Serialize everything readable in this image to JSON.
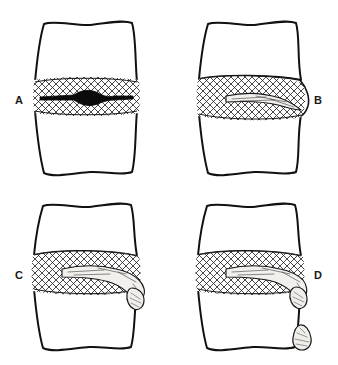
{
  "figure": {
    "background_color": "#ffffff",
    "ink_color": "#111111",
    "width": 338,
    "height": 365,
    "panel_count": 4
  },
  "panels": [
    {
      "id": "A",
      "label": "A",
      "label_position": "left",
      "label_x": 19,
      "label_y": 101,
      "stage_name": "disc degeneration",
      "description": "Intact vertebral bodies with hatched intervertebral disc and a dark spindle-shaped nucleus pulposus contained within the annulus.",
      "nucleus_style": "dark-solid",
      "has_extrusion": false,
      "has_free_fragment": false,
      "body_cx": 86,
      "body_top": 21,
      "body_bottom": 176,
      "disc_top": 80,
      "disc_bottom": 113
    },
    {
      "id": "B",
      "label": "B",
      "label_position": "right",
      "label_x": 318,
      "label_y": 101,
      "stage_name": "disc protrusion",
      "description": "Nucleus pulposus displaced posteriorly, bulging the annulus and contour of the disc margin to the right without rupture.",
      "nucleus_style": "light-outlined-tongue",
      "has_extrusion": false,
      "has_free_fragment": false,
      "body_cx": 250,
      "body_top": 21,
      "body_bottom": 176,
      "disc_top": 78,
      "disc_bottom": 116
    },
    {
      "id": "C",
      "label": "C",
      "label_position": "left",
      "label_x": 19,
      "label_y": 276,
      "stage_name": "disc extrusion",
      "description": "Nuclear material ruptures through the annulus and extrudes beyond the posterior vertebral margin, remaining attached to the parent disc.",
      "nucleus_style": "light-outlined-extruded",
      "has_extrusion": true,
      "has_free_fragment": false,
      "body_cx": 86,
      "body_top": 203,
      "body_bottom": 351,
      "disc_top": 253,
      "disc_bottom": 291
    },
    {
      "id": "D",
      "label": "D",
      "label_position": "right",
      "label_x": 318,
      "label_y": 276,
      "stage_name": "disc sequestration",
      "description": "Extruded nuclear material separates; a free sequestered fragment migrates inferiorly away from the disc space along the vertebral body.",
      "nucleus_style": "light-outlined-extruded",
      "has_extrusion": true,
      "has_free_fragment": true,
      "free_fragment_label": "sequestered-fragment",
      "body_cx": 250,
      "body_top": 203,
      "body_bottom": 351,
      "disc_top": 253,
      "disc_bottom": 291
    }
  ],
  "hatching": {
    "pattern_name": "cross-hatch-lattice",
    "stroke_color": "#1a1a1a",
    "stroke_width": 0.75,
    "spacing": 4
  }
}
